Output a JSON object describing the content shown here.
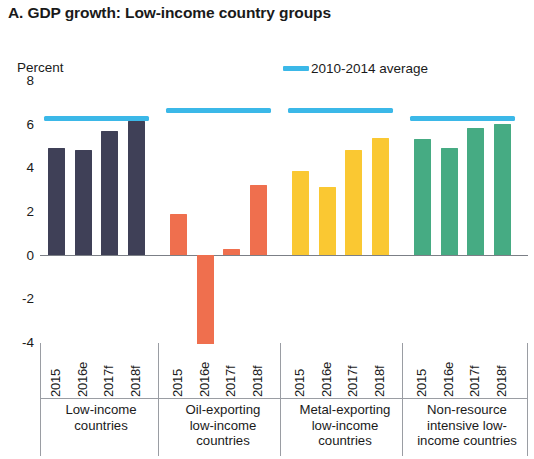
{
  "chart_data": {
    "type": "bar",
    "title": "A. GDP growth: Low-income country groups",
    "xlabel": "",
    "ylabel": "Percent",
    "ylim": [
      -4,
      8
    ],
    "yticks": [
      8,
      6,
      4,
      2,
      0,
      -2,
      -4
    ],
    "ytick_labels": [
      "8",
      "6",
      "4",
      "2",
      "0",
      "-2",
      "-4"
    ],
    "grid": false,
    "legend_position": "top-right",
    "legend": [
      {
        "name": "2010-2014 average",
        "color": "#3bb8e8",
        "marker": "line"
      }
    ],
    "categories": [
      "2015",
      "2016e",
      "2017f",
      "2018f"
    ],
    "groups": [
      {
        "name": "Low-income countries",
        "color": "#3f4057",
        "values": [
          4.9,
          4.8,
          5.65,
          6.1
        ],
        "average_2010_2014": 6.25
      },
      {
        "name": "Oil-exporting low-income countries",
        "color": "#ef6f4e",
        "values": [
          1.85,
          -4.1,
          0.25,
          3.2
        ],
        "average_2010_2014": 6.6
      },
      {
        "name": "Metal-exporting low-income countries",
        "color": "#fac832",
        "values": [
          3.85,
          3.1,
          4.8,
          5.35
        ],
        "average_2010_2014": 6.6
      },
      {
        "name": "Non-resource intensive low-income countries",
        "color": "#46ab83",
        "values": [
          5.3,
          4.9,
          5.8,
          6.0
        ],
        "average_2010_2014": 6.25
      }
    ]
  },
  "chart": {
    "title": "A. GDP growth: Low-income country groups",
    "unit_label": "Percent",
    "legend_label": "2010-2014 average",
    "legend_color": "#3bb8e8"
  },
  "group_labels": [
    {
      "lines": [
        "Low-income",
        "countries"
      ]
    },
    {
      "lines": [
        "Oil-exporting",
        "low-income",
        "countries"
      ]
    },
    {
      "lines": [
        "Metal-exporting",
        "low-income",
        "countries"
      ]
    },
    {
      "lines": [
        "Non-resource",
        "intensive low-",
        "income countries"
      ]
    }
  ]
}
